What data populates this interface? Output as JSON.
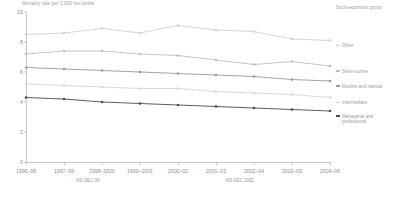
{
  "chart_data": {
    "type": "line",
    "title": "",
    "ylabel": "Mortality rate per 1,000 live births",
    "xlabel": "",
    "ylim": [
      0,
      10
    ],
    "yticks": [
      0,
      2,
      4,
      6,
      8,
      10
    ],
    "ytick_labels": [
      "0",
      "2",
      "4",
      "6",
      "8",
      "10"
    ],
    "grid": false,
    "legend_position": "right",
    "legend_title": "Socio-economic group",
    "categories": [
      "1996–98",
      "1997–99",
      "1998–2000",
      "1999–2001",
      "2000–02",
      "2001–03",
      "2002–04",
      "2003–05",
      "2004–06"
    ],
    "period_groups": [
      {
        "label": "NS-SEC 90",
        "from": "1996–98",
        "to": "2000–02"
      },
      {
        "label": "NS-SEC 2001",
        "from": "2001–03",
        "to": "2004–06"
      }
    ],
    "series": [
      {
        "name": "Other",
        "color": "#d0d0d0",
        "values": [
          8.5,
          8.6,
          8.9,
          8.6,
          9.1,
          8.8,
          8.7,
          8.2,
          8.1
        ]
      },
      {
        "name": "Semi-routine",
        "color": "#bdbdbd",
        "values": [
          7.2,
          7.4,
          7.4,
          7.2,
          7.1,
          6.8,
          6.5,
          6.7,
          6.4
        ]
      },
      {
        "name": "Routine and manual",
        "color": "#9a9a9a",
        "values": [
          6.3,
          6.2,
          6.1,
          6.0,
          5.9,
          5.8,
          5.7,
          5.5,
          5.4
        ]
      },
      {
        "name": "Intermediate",
        "color": "#d6d6d6",
        "values": [
          5.2,
          5.1,
          5.0,
          4.9,
          4.9,
          4.7,
          4.6,
          4.5,
          4.3
        ]
      },
      {
        "name": "Managerial and professional",
        "color": "#4a4a4a",
        "values": [
          4.3,
          4.2,
          4.0,
          3.9,
          3.8,
          3.7,
          3.6,
          3.5,
          3.4
        ]
      }
    ]
  },
  "legend": {
    "title": "Socio-economic group",
    "items": [
      {
        "label": "Other",
        "color": "#d0d0d0"
      },
      {
        "label": "Semi-routine",
        "color": "#bdbdbd"
      },
      {
        "label": "Routine and manual",
        "color": "#9a9a9a"
      },
      {
        "label": "Intermediate",
        "color": "#d6d6d6"
      },
      {
        "label": "Managerial and professional",
        "color": "#4a4a4a"
      }
    ]
  },
  "axes": {
    "y_title": "Mortality rate per 1,000 live births",
    "x_group_1": "NS-SEC 90",
    "x_group_2": "NS-SEC 2001"
  }
}
